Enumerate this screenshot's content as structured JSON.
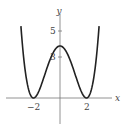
{
  "chart_data": {
    "type": "line",
    "title": "",
    "xlabel": "x",
    "ylabel": "y",
    "function": "y = (x^2 - 4)^2 / 4",
    "x_ticks": [
      {
        "value": -2,
        "label": "−2"
      },
      {
        "value": 2,
        "label": "2"
      }
    ],
    "y_ticks": [
      {
        "value": 3,
        "label": "3"
      },
      {
        "value": 5,
        "label": "5"
      }
    ],
    "xlim": [
      -3,
      4
    ],
    "ylim": [
      -2,
      6.5
    ],
    "grid": false,
    "legend": null,
    "series": [
      {
        "name": "curve",
        "x": [
          -2.9,
          -2.5,
          -2,
          -1.5,
          -1,
          -0.5,
          0,
          0.5,
          1,
          1.5,
          2,
          2.5,
          2.9
        ],
        "y": [
          5.98,
          1.27,
          0,
          0.95,
          2.25,
          3.52,
          4,
          3.52,
          2.25,
          0.95,
          0,
          1.27,
          5.98
        ]
      }
    ],
    "key_points": {
      "local_max": [
        0,
        4
      ],
      "minima": [
        [
          -2,
          0
        ],
        [
          2,
          0
        ]
      ]
    },
    "colors": {
      "curve": "#222222",
      "axes": "#555555"
    }
  }
}
